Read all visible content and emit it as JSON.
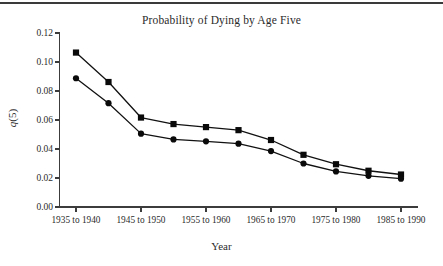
{
  "figure": {
    "title": "Probability of Dying by Age Five",
    "top_rule": true
  },
  "axis": {
    "x_title": "Year",
    "y_title_italic": "q",
    "y_title_rest": "(5)"
  },
  "chart_data": {
    "type": "line",
    "title": "Probability of Dying by Age Five",
    "xlabel": "Year",
    "ylabel": "q(5)",
    "ylim": [
      0.0,
      0.12
    ],
    "ytick_labels": [
      "0.00",
      "0.02",
      "0.04",
      "0.06",
      "0.08",
      "0.10",
      "0.12"
    ],
    "ytick_values": [
      0.0,
      0.02,
      0.04,
      0.06,
      0.08,
      0.1,
      0.12
    ],
    "xtick_labels": [
      "1935 to 1940",
      "1945 to 1950",
      "1955 to 1960",
      "1965 to 1970",
      "1975 to 1980",
      "1985 to 1990"
    ],
    "xtick_indices": [
      0,
      2,
      4,
      6,
      8,
      10
    ],
    "x_indices": [
      0,
      1,
      2,
      3,
      4,
      5,
      6,
      7,
      8,
      9,
      10
    ],
    "grid": false,
    "legend": "none",
    "series": [
      {
        "name": "upper",
        "marker": "square",
        "color": "#0a0a0a",
        "values": [
          0.1065,
          0.0862,
          0.0617,
          0.0572,
          0.0551,
          0.053,
          0.0462,
          0.036,
          0.0295,
          0.025,
          0.0224
        ]
      },
      {
        "name": "lower",
        "marker": "circle",
        "color": "#0a0a0a",
        "values": [
          0.0888,
          0.0716,
          0.0506,
          0.0466,
          0.0453,
          0.0437,
          0.0386,
          0.03,
          0.0245,
          0.0215,
          0.0195
        ]
      }
    ]
  }
}
